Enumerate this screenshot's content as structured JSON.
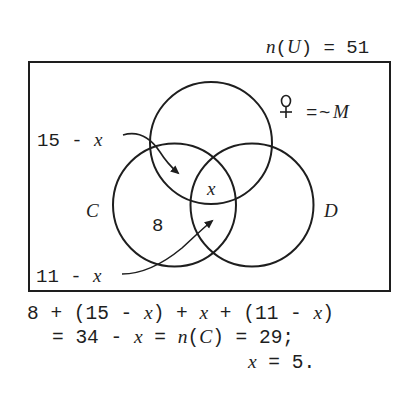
{
  "universe": {
    "label_prefix": "n",
    "label_open": "(",
    "label_set": "U",
    "label_close": ")",
    "label_eq": " = ",
    "label_value": "51",
    "total": 51
  },
  "legend": {
    "symbol": "♀",
    "symbol_meaning": "female-symbol",
    "equals": "=",
    "tilde": "~",
    "set": "M"
  },
  "sets": {
    "top": {
      "label": ""
    },
    "left": {
      "label": "C"
    },
    "right": {
      "label": "D"
    }
  },
  "regions": {
    "c_only": "8",
    "center": "x"
  },
  "callouts": {
    "upper": {
      "num": "15",
      "op": " - ",
      "var": "x"
    },
    "lower": {
      "num": "11",
      "op": " - ",
      "var": "x"
    }
  },
  "equations": {
    "line1": {
      "a": "8 + (15 - ",
      "b": "x",
      "c": ") + ",
      "d": "x",
      "e": " + (11 - ",
      "f": "x",
      "g": ")"
    },
    "line2": {
      "a": "= 34 - ",
      "b": "x",
      "c": " = ",
      "d": "n",
      "e": "(",
      "f": "C",
      "g": ") = 29;"
    },
    "line3": {
      "a": "x",
      "b": " = 5."
    }
  },
  "colors": {
    "stroke": "#1e1e1e",
    "background": "#ffffff"
  }
}
